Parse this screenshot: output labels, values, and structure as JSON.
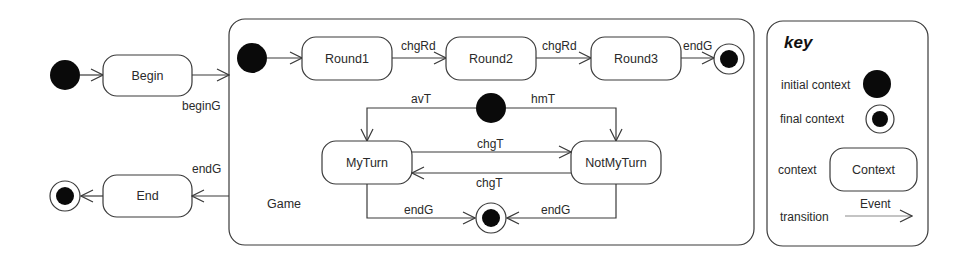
{
  "diagram": {
    "type": "state-machine",
    "states": {
      "begin": "Begin",
      "end": "End",
      "game": "Game",
      "round1": "Round1",
      "round2": "Round2",
      "round3": "Round3",
      "my_turn": "MyTurn",
      "not_my_turn": "NotMyTurn"
    },
    "transitions": {
      "begin_to_game": "beginG",
      "game_to_end": "endG",
      "round1_to_round2": "chgRd",
      "round2_to_round3": "chgRd",
      "round3_to_final": "endG",
      "initial_to_myturn": "avT",
      "initial_to_notmyturn": "hmT",
      "myturn_to_notmyturn": "chgT",
      "notmyturn_to_myturn": "chgT",
      "myturn_to_final": "endG",
      "notmyturn_to_final": "endG"
    },
    "key": {
      "title": "key",
      "initial_context": "initial context",
      "final_context": "final context",
      "context": "context",
      "context_sample": "Context",
      "transition": "transition",
      "transition_event": "Event"
    },
    "colors": {
      "stroke": "#3a3a3a",
      "fill_dot": "#0a0a0a",
      "background": "#ffffff"
    }
  }
}
